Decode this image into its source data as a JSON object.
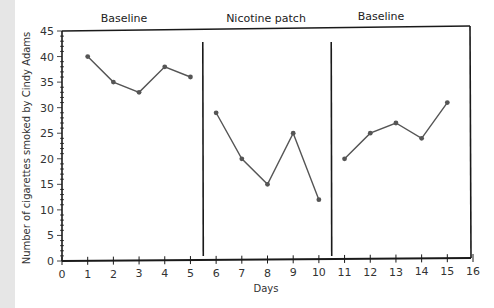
{
  "chart_data": {
    "type": "line",
    "title": "",
    "xlabel": "Days",
    "ylabel": "Number of cigarettes smoked by Cindy Adams",
    "xlim": [
      0,
      16
    ],
    "ylim": [
      0,
      45
    ],
    "x_ticks": [
      0,
      1,
      2,
      3,
      4,
      5,
      6,
      7,
      8,
      9,
      10,
      11,
      12,
      13,
      14,
      15,
      16
    ],
    "y_ticks": [
      0,
      5,
      10,
      15,
      20,
      25,
      30,
      35,
      40,
      45
    ],
    "grid": false,
    "legend": null,
    "phases": [
      {
        "label": "Baseline",
        "x_start": 0,
        "x_end": 5.5
      },
      {
        "label": "Nicotine patch",
        "x_start": 5.5,
        "x_end": 10.5
      },
      {
        "label": "Baseline",
        "x_start": 10.5,
        "x_end": 16
      }
    ],
    "phase_lines": [
      5.5,
      10.5
    ],
    "series": [
      {
        "name": "Baseline",
        "x": [
          1,
          2,
          3,
          4,
          5
        ],
        "values": [
          40,
          35,
          33,
          38,
          36
        ]
      },
      {
        "name": "Nicotine patch",
        "x": [
          6,
          7,
          8,
          9,
          10
        ],
        "values": [
          29,
          20,
          15,
          25,
          12
        ]
      },
      {
        "name": "Baseline",
        "x": [
          11,
          12,
          13,
          14,
          15
        ],
        "values": [
          20,
          25,
          27,
          24,
          31
        ]
      }
    ]
  },
  "labels": {
    "phase1": "Baseline",
    "phase2": "Nicotine patch",
    "phase3": "Baseline",
    "xlabel": "Days",
    "ylabel": "Number of cigarettes smoked by Cindy Adams"
  },
  "colors": {
    "axis": "#1a1a1a",
    "line": "#555555",
    "marker": "#555555",
    "strip": "#e6e6e6"
  }
}
